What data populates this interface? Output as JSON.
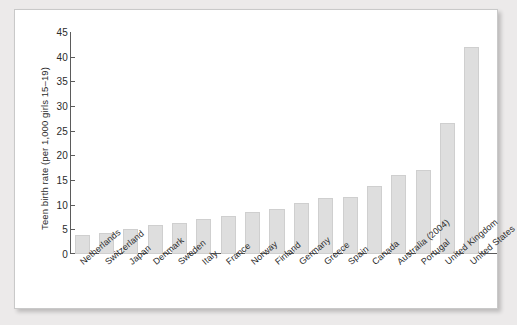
{
  "chart_data": {
    "type": "bar",
    "title": "",
    "subtitle": "",
    "xlabel": "",
    "ylabel": "Teen birth rate (per 1,000 girls 15–19)",
    "ylim": [
      0,
      45
    ],
    "yticks": [
      0,
      5,
      10,
      15,
      20,
      25,
      30,
      35,
      40,
      45
    ],
    "grid": false,
    "legend": false,
    "bar_color": "#dedede",
    "bar_edge_color": "#cfcfcf",
    "axis_color": "#5b5b5b",
    "categories": [
      "Netherlands",
      "Switzerland",
      "Japan",
      "Denmark",
      "Sweden",
      "Italy",
      "France",
      "Norway",
      "Finland",
      "Germany",
      "Greece",
      "Spain",
      "Canada",
      "Australia (2004)",
      "Portugal",
      "United Kingdom",
      "United States"
    ],
    "values": [
      3.8,
      4.3,
      5.1,
      5.9,
      6.2,
      7.0,
      7.8,
      8.6,
      9.2,
      10.3,
      11.4,
      11.5,
      13.7,
      16.0,
      17.0,
      26.5,
      42.0
    ]
  }
}
